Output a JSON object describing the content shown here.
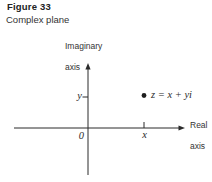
{
  "figure": {
    "label": "Figure 33",
    "caption": "Complex plane"
  },
  "diagram": {
    "imaginary_axis": {
      "line1": "Imaginary",
      "line2": "axis"
    },
    "real_axis": {
      "line1": "Real",
      "line2": "axis"
    },
    "origin_label": "0",
    "y_tick_label": "y",
    "x_tick_label": "x",
    "point": {
      "label": "z = x + yi",
      "marker": "filled-dot"
    }
  },
  "colors": {
    "ink": "#2b2b2b",
    "background": "#ffffff"
  }
}
